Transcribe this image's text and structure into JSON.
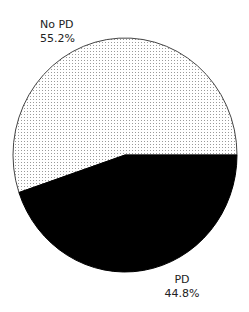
{
  "chart_data": {
    "type": "pie",
    "title": "",
    "categories": [
      "PD",
      "No PD"
    ],
    "values": [
      44.8,
      55.2
    ],
    "units": "%",
    "slices": [
      {
        "name": "PD",
        "value": 44.8,
        "label": "PD",
        "value_label": "44.8%",
        "fill": "solid",
        "color": "#000000"
      },
      {
        "name": "No PD",
        "value": 55.2,
        "label": "No PD",
        "value_label": "55.2%",
        "fill": "dotted",
        "color": "#cccccc"
      }
    ],
    "start_angle_deg": 0,
    "direction": "clockwise",
    "legend": "none",
    "grid": false
  },
  "labels": {
    "nopd_name": "No PD",
    "nopd_value": "55.2%",
    "pd_name": "PD",
    "pd_value": "44.8%"
  },
  "colors": {
    "pd_fill": "#000000",
    "nopd_dot": "#9a9a9a",
    "outline": "#444444"
  }
}
